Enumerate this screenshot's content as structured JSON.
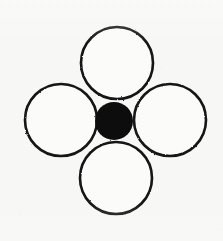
{
  "figure": {
    "title": "Four circles arranged around a filled central circle",
    "canvas": {
      "width": 223,
      "height": 241,
      "background_color": "#f7f7f5"
    },
    "stroke": {
      "color": "#141414",
      "width": 2.6
    },
    "fill": {
      "outline_circle_color": "#fbfbfa",
      "solid_circle_color": "#0d0d0d"
    },
    "shapes": [
      {
        "name": "top-circle",
        "style": "outline",
        "cx": 117,
        "cy": 63,
        "r": 36,
        "label": "Top circle"
      },
      {
        "name": "left-circle",
        "style": "outline",
        "cx": 61,
        "cy": 120,
        "r": 36,
        "label": "Left circle"
      },
      {
        "name": "right-circle",
        "style": "outline",
        "cx": 170,
        "cy": 120,
        "r": 36,
        "label": "Right circle"
      },
      {
        "name": "bottom-circle",
        "style": "outline",
        "cx": 116,
        "cy": 178,
        "r": 36,
        "label": "Bottom circle"
      },
      {
        "name": "center-circle",
        "style": "solid",
        "cx": 114,
        "cy": 121,
        "r": 19,
        "label": "Center filled circle"
      }
    ],
    "counts": {
      "outline_circles": 4,
      "solid_circles": 1,
      "total_circles": 5
    }
  }
}
